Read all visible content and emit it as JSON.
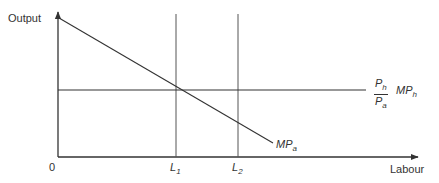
{
  "diagram": {
    "title": "",
    "y_axis_label": "Output",
    "x_axis_label": "Labour",
    "origin_label": "0",
    "curves": {
      "mp_a": {
        "base": "MP",
        "sub": "a"
      },
      "mp_h": {
        "frac_num_base": "P",
        "frac_num_sub": "h",
        "frac_den_base": "P",
        "frac_den_sub": "a",
        "base": "MP",
        "sub": "h"
      }
    },
    "x_ticks": [
      {
        "base": "L",
        "sub": "1"
      },
      {
        "base": "L",
        "sub": "2"
      }
    ],
    "colors": {
      "line": "#333333",
      "axis": "#333333",
      "background": "#ffffff"
    }
  }
}
